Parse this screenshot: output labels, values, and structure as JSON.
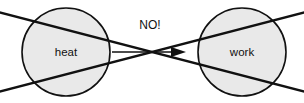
{
  "figure": {
    "width": 304,
    "height": 103,
    "background_color": "#ffffff"
  },
  "nodes": [
    {
      "id": "heat",
      "label": "heat",
      "cx": 66,
      "cy": 52,
      "r": 44,
      "fill_color": "#e9e9e9",
      "stroke_color": "#111111",
      "stroke_width": 1.6,
      "label_x": 66,
      "label_y": 56
    },
    {
      "id": "work",
      "label": "work",
      "cx": 242,
      "cy": 52,
      "r": 44,
      "fill_color": "#e9e9e9",
      "stroke_color": "#111111",
      "stroke_width": 1.6,
      "label_x": 242,
      "label_y": 56
    }
  ],
  "arrow": {
    "id": "heat-to-work-arrow",
    "label": "",
    "x1": 112,
    "y1": 52,
    "x2": 186,
    "y2": 52,
    "stroke_color": "#111111",
    "stroke_width": 1.5,
    "head_points": "186,52 172,47.5 172,56.5"
  },
  "cross_out": {
    "id": "cross-out-x",
    "stroke_color": "#111111",
    "stroke_width": 2.6,
    "lines": [
      {
        "id": "cross-line-descending",
        "x1": -2,
        "y1": 12,
        "x2": 306,
        "y2": 92
      },
      {
        "id": "cross-line-ascending",
        "x1": -2,
        "y1": 92,
        "x2": 306,
        "y2": 12
      }
    ],
    "intersection": {
      "x": 152,
      "y": 52
    }
  },
  "annotation": {
    "id": "no-annotation",
    "text": "NO!",
    "x": 150,
    "y": 29,
    "color": "#111111"
  }
}
